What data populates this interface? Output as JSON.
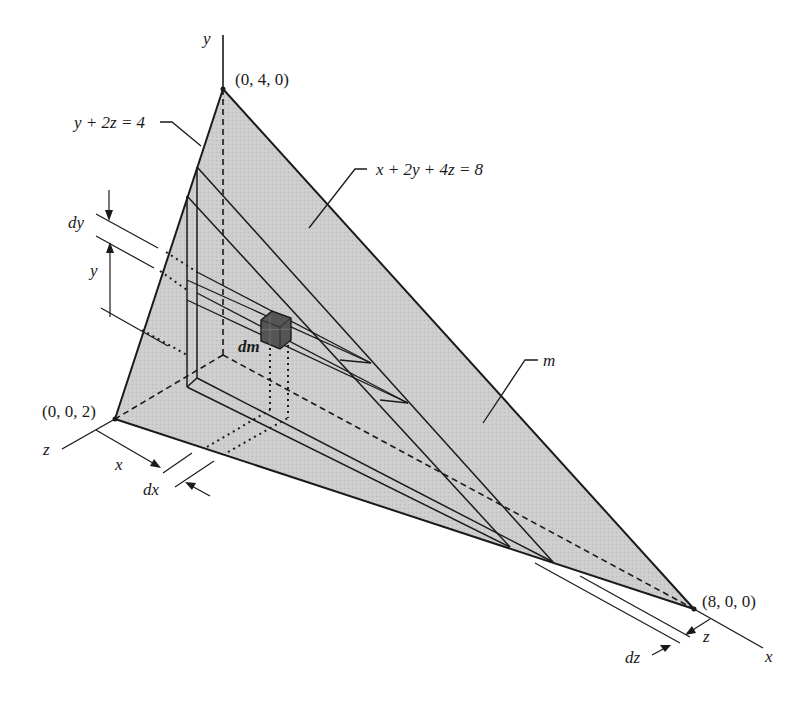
{
  "figure": {
    "fill_color": "#c9c9c9",
    "line_color": "#1a1a1a",
    "cube_color": "#555555"
  },
  "labels": {
    "y_axis": "y",
    "z_axis": "z",
    "x_axis": "x",
    "vertex_top": "(0, 4, 0)",
    "vertex_left": "(0, 0, 2)",
    "vertex_right": "(8, 0, 0)",
    "plane_eq": "x + 2y + 4z = 8",
    "trace_eq": "y + 2z = 4",
    "mass": "m",
    "element": "dm",
    "dy": "dy",
    "y_dim": "y",
    "x_dim": "x",
    "dx": "dx",
    "dz": "dz",
    "z_dim": "z"
  }
}
